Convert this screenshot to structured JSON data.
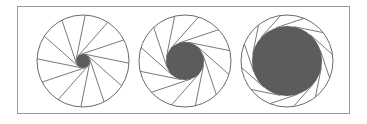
{
  "diagram": {
    "blade_count": 12,
    "colors": {
      "frame": "#9a9a9a",
      "blade_line": "#6a6a6a",
      "pupil": "#5c5c5c",
      "background": "#ffffff"
    },
    "apertures": [
      {
        "name": "small-aperture",
        "cx": 83,
        "cy": 61,
        "r": 46,
        "pupil_r": 7
      },
      {
        "name": "medium-aperture",
        "cx": 185,
        "cy": 61,
        "r": 46,
        "pupil_r": 19
      },
      {
        "name": "large-aperture",
        "cx": 287,
        "cy": 61,
        "r": 46,
        "pupil_r": 35
      }
    ]
  }
}
